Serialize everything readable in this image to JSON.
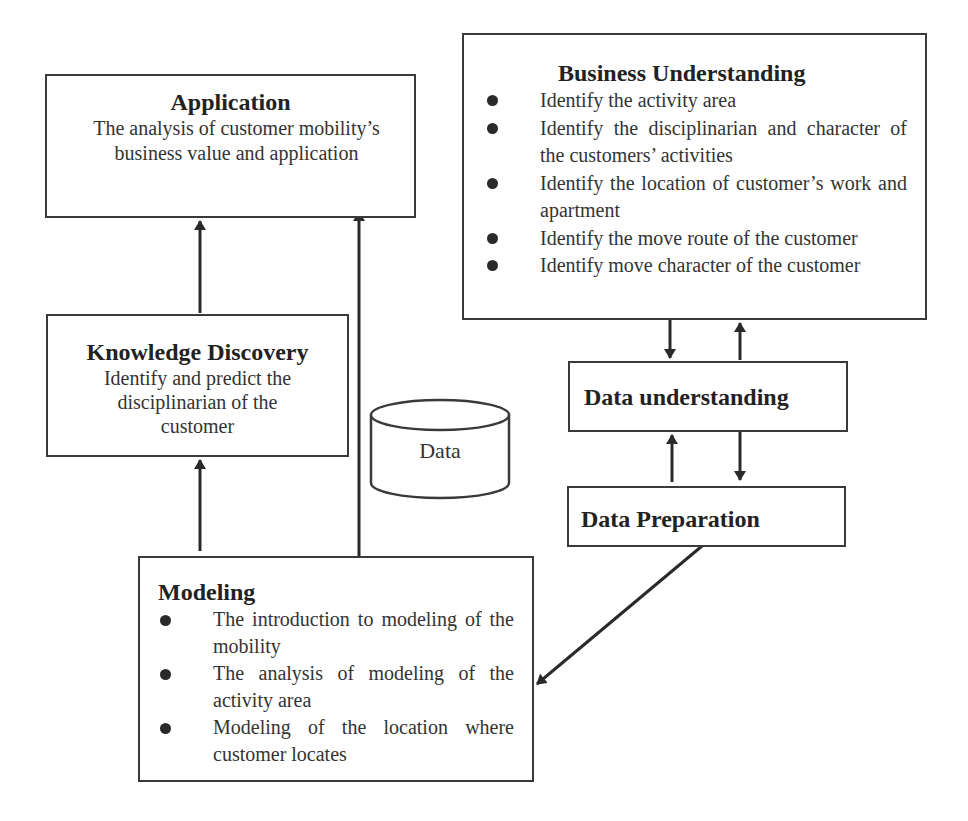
{
  "diagram": {
    "application": {
      "title": "Application",
      "description": "The analysis of customer mobility’s business value and application"
    },
    "business_understanding": {
      "title": "Business Understanding",
      "items": [
        "Identify the activity area",
        "Identify the disciplinarian and character of the customers’ activities",
        "Identify the location of customer’s work and apartment",
        "Identify the move route of the customer",
        "Identify move character of the customer"
      ]
    },
    "knowledge_discovery": {
      "title": "Knowledge Discovery",
      "description": "Identify and predict the disciplinarian of the customer"
    },
    "data_store": {
      "label": "Data"
    },
    "data_understanding": {
      "title": "Data understanding"
    },
    "data_preparation": {
      "title": "Data Preparation"
    },
    "modeling": {
      "title": "Modeling",
      "items": [
        "The introduction to modeling of the mobility",
        "The analysis of modeling of the activity area",
        "Modeling of the location where customer locates"
      ]
    },
    "edges": [
      {
        "from": "Knowledge Discovery",
        "to": "Application"
      },
      {
        "from": "Modeling",
        "to": "Application"
      },
      {
        "from": "Modeling",
        "to": "Knowledge Discovery"
      },
      {
        "from": "Business Understanding",
        "to": "Data understanding"
      },
      {
        "from": "Data understanding",
        "to": "Business Understanding"
      },
      {
        "from": "Data Preparation",
        "to": "Data understanding"
      },
      {
        "from": "Data understanding",
        "to": "Data Preparation"
      },
      {
        "from": "Data Preparation",
        "to": "Modeling"
      }
    ],
    "colors": {
      "line": "#2a2a2a",
      "border": "#3a3a3a",
      "background": "#ffffff"
    }
  }
}
